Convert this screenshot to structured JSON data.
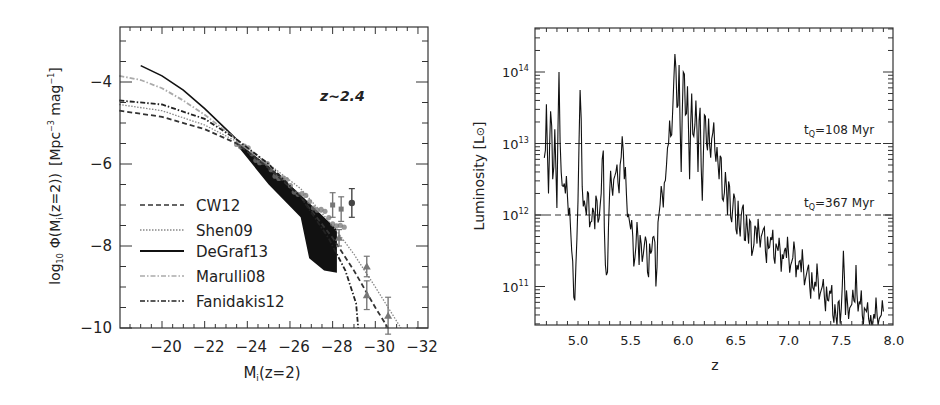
{
  "chart_data": [
    {
      "type": "line",
      "panel": "left",
      "title": "",
      "annotation": "z~2.4",
      "xlabel": "M_i(z=2)",
      "ylabel": "log10 Φ(M_i(z=2)) [Mpc^-3 mag^-1]",
      "xlim": [
        -18,
        -32.5
      ],
      "ylim": [
        -10,
        -2.65
      ],
      "x_ticks": [
        -20,
        -22,
        -24,
        -26,
        -28,
        -30,
        -32
      ],
      "x_tick_labels": [
        "−20",
        "−22",
        "−24",
        "−26",
        "−28",
        "−30",
        "−32"
      ],
      "y_ticks": [
        -4,
        -6,
        -8,
        -10
      ],
      "y_tick_labels": [
        "−4",
        "−6",
        "−8",
        "−10"
      ],
      "grid": false,
      "legend_position": "lower left",
      "series": [
        {
          "name": "CW12",
          "style": "dashed",
          "color": "#333333",
          "label_color": "#444444",
          "x": [
            -18,
            -20,
            -22,
            -23.5,
            -25,
            -26.5,
            -28,
            -29,
            -30,
            -30.6
          ],
          "y": [
            -4.7,
            -4.85,
            -5.15,
            -5.5,
            -6.1,
            -6.8,
            -7.8,
            -8.6,
            -9.5,
            -10
          ]
        },
        {
          "name": "Shen09",
          "style": "dotted",
          "color": "#888888",
          "label_color": "#555555",
          "x": [
            -18,
            -20,
            -22,
            -23.5,
            -25,
            -26.5,
            -28,
            -29,
            -30,
            -31.2
          ],
          "y": [
            -4.55,
            -4.7,
            -5.05,
            -5.45,
            -6.0,
            -6.6,
            -7.5,
            -8.2,
            -9.0,
            -10
          ]
        },
        {
          "name": "DeGraf13",
          "style": "solid",
          "color": "#111111",
          "label_color": "#111111",
          "x": [
            -19,
            -20,
            -21,
            -22,
            -23,
            -23.6
          ],
          "y": [
            -3.6,
            -3.85,
            -4.2,
            -4.65,
            -5.15,
            -5.45
          ]
        },
        {
          "name": "Marulli08",
          "style": "dash-dot",
          "color": "#aaaaaa",
          "label_color": "#aaaaaa",
          "x": [
            -18,
            -19,
            -20,
            -21,
            -22,
            -23,
            -23.6
          ],
          "y": [
            -3.85,
            -3.95,
            -4.15,
            -4.45,
            -4.8,
            -5.2,
            -5.45
          ]
        },
        {
          "name": "Fanidakis12",
          "style": "dash-dot",
          "color": "#222222",
          "label_color": "#111111",
          "x": [
            -18,
            -20,
            -22,
            -23.5,
            -25,
            -26.5,
            -27.8,
            -28.6,
            -29.1,
            -29.2
          ],
          "y": [
            -4.45,
            -4.55,
            -4.9,
            -5.4,
            -6.0,
            -6.8,
            -7.8,
            -8.6,
            -9.4,
            -10
          ]
        }
      ],
      "shaded_region": {
        "name": "simulation spread",
        "color": "#111111",
        "x_upper": [
          -23.6,
          -25,
          -26.5,
          -28.2
        ],
        "y_upper": [
          -5.5,
          -6.05,
          -6.75,
          -7.6
        ],
        "x_lower": [
          -28.2,
          -27.6,
          -26.9,
          -26.5,
          -25,
          -23.6
        ],
        "y_lower": [
          -8.65,
          -8.6,
          -8.3,
          -7.3,
          -6.5,
          -5.6
        ]
      },
      "data_points": [
        {
          "x": -28.9,
          "y": -6.95,
          "err": 0.35,
          "marker": "circle"
        },
        {
          "x": -28.4,
          "y": -7.1,
          "err": 0.3,
          "marker": "square"
        },
        {
          "x": -28.0,
          "y": -7.0,
          "err": 0.3,
          "marker": "square"
        },
        {
          "x": -29.6,
          "y": -8.5,
          "err": 0.25,
          "marker": "triangle"
        },
        {
          "x": -29.6,
          "y": -9.2,
          "err": 0.35,
          "marker": "triangle"
        },
        {
          "x": -30.6,
          "y": -9.7,
          "err": 0.45,
          "marker": "triangle"
        },
        {
          "x": -28.3,
          "y": -7.8,
          "err": 0.2,
          "marker": "triangle"
        }
      ]
    },
    {
      "type": "line",
      "panel": "right",
      "title": "",
      "xlabel": "z",
      "ylabel": "Luminosity [L⊙]",
      "yscale": "log",
      "xlim": [
        4.6,
        8.0
      ],
      "ylim_log10": [
        10.46,
        14.62
      ],
      "x_ticks": [
        5.0,
        5.5,
        6.0,
        6.5,
        7.0,
        7.5,
        8.0
      ],
      "x_tick_labels": [
        "5.0",
        "5.5",
        "6.0",
        "6.5",
        "7.0",
        "7.5",
        "8.0"
      ],
      "y_ticks_log10": [
        11,
        12,
        13,
        14
      ],
      "y_tick_labels": [
        "10",
        "10",
        "10",
        "10"
      ],
      "y_tick_exponents": [
        "11",
        "12",
        "13",
        "14"
      ],
      "grid": false,
      "reference_lines": [
        {
          "label": "t_Q=108 Myr",
          "log10_y": 13,
          "style": "dashed"
        },
        {
          "label": "t_Q=367 Myr",
          "log10_y": 12,
          "style": "dashed"
        }
      ],
      "series": [
        {
          "name": "luminosity history",
          "style": "solid",
          "color": "#111111",
          "z": [
            4.68,
            4.7,
            4.72,
            4.74,
            4.76,
            4.78,
            4.8,
            4.82,
            4.84,
            4.86,
            4.88,
            4.9,
            4.92,
            4.94,
            4.96,
            4.98,
            5.0,
            5.02,
            5.04,
            5.06,
            5.08,
            5.1,
            5.12,
            5.14,
            5.16,
            5.18,
            5.2,
            5.22,
            5.24,
            5.26,
            5.28,
            5.3,
            5.32,
            5.34,
            5.36,
            5.38,
            5.4,
            5.42,
            5.44,
            5.46,
            5.48,
            5.5,
            5.52,
            5.54,
            5.56,
            5.58,
            5.6,
            5.62,
            5.64,
            5.66,
            5.68,
            5.7,
            5.72,
            5.74,
            5.76,
            5.78,
            5.8,
            5.82,
            5.84,
            5.86,
            5.88,
            5.9,
            5.92,
            5.94,
            5.96,
            5.98,
            6.0,
            6.02,
            6.04,
            6.06,
            6.08,
            6.1,
            6.12,
            6.14,
            6.16,
            6.18,
            6.2,
            6.22,
            6.24,
            6.26,
            6.28,
            6.3,
            6.32,
            6.34,
            6.36,
            6.38,
            6.4,
            6.42,
            6.44,
            6.46,
            6.48,
            6.5,
            6.52,
            6.54,
            6.56,
            6.58,
            6.6,
            6.62,
            6.64,
            6.66,
            6.68,
            6.7,
            6.72,
            6.74,
            6.76,
            6.78,
            6.8,
            6.82,
            6.84,
            6.86,
            6.88,
            6.9,
            6.92,
            6.94,
            6.96,
            6.98,
            7.0,
            7.02,
            7.04,
            7.06,
            7.08,
            7.1,
            7.12,
            7.14,
            7.16,
            7.18,
            7.2,
            7.22,
            7.24,
            7.26,
            7.28,
            7.3,
            7.32,
            7.34,
            7.36,
            7.38,
            7.4,
            7.42,
            7.44,
            7.46,
            7.48,
            7.5,
            7.52,
            7.54,
            7.56,
            7.58,
            7.6,
            7.62,
            7.64,
            7.66,
            7.68,
            7.7,
            7.72,
            7.74,
            7.76,
            7.78,
            7.8,
            7.82,
            7.84,
            7.86,
            7.88,
            7.9,
            7.92,
            7.94,
            7.96,
            7.98,
            8.0
          ],
          "log10L": [
            12.8,
            13.55,
            12.3,
            13.45,
            12.5,
            13.2,
            12.1,
            14.0,
            12.6,
            12.4,
            12.3,
            12.25,
            12.1,
            11.5,
            10.85,
            11.3,
            12.2,
            13.75,
            12.4,
            12.2,
            12.0,
            12.3,
            11.9,
            12.1,
            11.8,
            12.2,
            11.95,
            12.3,
            12.9,
            11.3,
            11.2,
            12.3,
            12.4,
            12.5,
            12.6,
            12.45,
            12.7,
            13.1,
            12.5,
            12.3,
            12.0,
            11.8,
            11.7,
            11.4,
            11.9,
            11.3,
            11.6,
            11.45,
            11.7,
            11.2,
            11.6,
            11.5,
            11.7,
            11.0,
            11.9,
            12.15,
            12.3,
            12.45,
            12.7,
            13.0,
            13.1,
            13.5,
            14.25,
            13.5,
            14.1,
            12.6,
            14.0,
            13.4,
            13.8,
            12.5,
            13.7,
            13.1,
            13.6,
            12.6,
            13.5,
            12.2,
            13.4,
            13.0,
            13.35,
            12.8,
            13.15,
            12.9,
            12.95,
            12.5,
            12.8,
            12.2,
            12.6,
            12.0,
            12.4,
            11.9,
            12.3,
            11.8,
            12.2,
            11.7,
            12.1,
            11.65,
            12.0,
            11.6,
            11.9,
            11.5,
            11.85,
            11.6,
            11.75,
            11.7,
            11.8,
            11.5,
            11.7,
            11.55,
            11.65,
            11.4,
            11.6,
            11.5,
            11.5,
            11.45,
            11.5,
            11.4,
            11.45,
            11.3,
            11.4,
            11.5,
            11.3,
            11.35,
            11.2,
            11.3,
            11.1,
            11.25,
            11.0,
            11.2,
            10.95,
            11.0,
            11.1,
            10.9,
            11.0,
            10.85,
            11.0,
            10.8,
            10.9,
            10.6,
            10.75,
            10.4,
            10.8,
            10.7,
            11.5,
            10.6,
            10.75,
            10.7,
            10.75,
            10.8,
            11.3,
            10.65,
            10.75,
            10.6,
            10.7,
            10.65,
            10.55,
            10.6,
            10.5,
            10.55,
            10.6,
            10.55,
            10.6,
            10.65
          ]
        }
      ]
    }
  ],
  "left_panel": {
    "annotation": "z~2.4",
    "xlabel_main": "M",
    "xlabel_sub": "i",
    "xlabel_rest": "(z=2)",
    "ylabel_prefix": "log",
    "ylabel_prefix_sub": "10",
    "ylabel_phi": "Φ(M",
    "ylabel_phi_sub": "i",
    "ylabel_phi_rest": "(z=2))",
    "ylabel_units": "[Mpc",
    "ylabel_units_sup1": "−3",
    "ylabel_units_mid": " mag",
    "ylabel_units_sup2": "−1",
    "ylabel_units_end": "]",
    "legend": [
      {
        "label": "CW12"
      },
      {
        "label": "Shen09"
      },
      {
        "label": "DeGraf13"
      },
      {
        "label": "Marulli08"
      },
      {
        "label": "Fanidakis12"
      }
    ]
  },
  "right_panel": {
    "xlabel": "z",
    "ylabel_main": "Luminosity [L",
    "ylabel_sun": "⊙",
    "ylabel_end": "]",
    "ref_label_1": "t",
    "ref_label_1_sub": "Q",
    "ref_label_1_rest": "=108 Myr",
    "ref_label_2": "t",
    "ref_label_2_sub": "Q",
    "ref_label_2_rest": "=367 Myr"
  }
}
